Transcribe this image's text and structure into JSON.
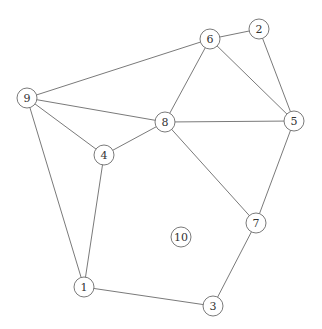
{
  "graph": {
    "type": "undirected",
    "node_radius": 10,
    "colors": {
      "stroke": "#7a7a7a",
      "label": "#333333",
      "fill": "#ffffff",
      "background": "#ffffff"
    },
    "nodes": [
      {
        "id": "1",
        "label": "1",
        "x": 84,
        "y": 287
      },
      {
        "id": "2",
        "label": "2",
        "x": 259,
        "y": 29
      },
      {
        "id": "3",
        "label": "3",
        "x": 213,
        "y": 306
      },
      {
        "id": "4",
        "label": "4",
        "x": 104,
        "y": 155
      },
      {
        "id": "5",
        "label": "5",
        "x": 294,
        "y": 121
      },
      {
        "id": "6",
        "label": "6",
        "x": 210,
        "y": 39
      },
      {
        "id": "7",
        "label": "7",
        "x": 256,
        "y": 223
      },
      {
        "id": "8",
        "label": "8",
        "x": 165,
        "y": 122
      },
      {
        "id": "9",
        "label": "9",
        "x": 27,
        "y": 98
      },
      {
        "id": "10",
        "label": "10",
        "x": 181,
        "y": 237
      }
    ],
    "edges": [
      [
        "9",
        "6"
      ],
      [
        "9",
        "8"
      ],
      [
        "9",
        "4"
      ],
      [
        "9",
        "1"
      ],
      [
        "4",
        "8"
      ],
      [
        "4",
        "1"
      ],
      [
        "8",
        "6"
      ],
      [
        "8",
        "5"
      ],
      [
        "8",
        "7"
      ],
      [
        "6",
        "2"
      ],
      [
        "6",
        "5"
      ],
      [
        "2",
        "5"
      ],
      [
        "5",
        "7"
      ],
      [
        "7",
        "3"
      ],
      [
        "1",
        "3"
      ]
    ]
  }
}
